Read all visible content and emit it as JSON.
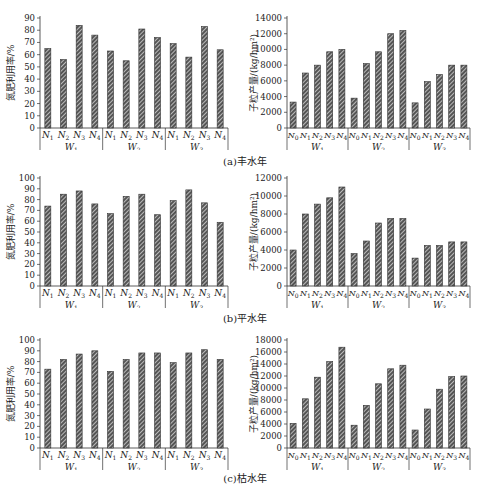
{
  "figure": {
    "captions": [
      "(a)丰水年",
      "(b)平水年",
      "(c)枯水年"
    ]
  },
  "colors": {
    "bar_fill": "#555555",
    "hatch": "#ffffff",
    "axis": "#333333"
  },
  "chart_data": [
    {
      "id": "a-left",
      "type": "bar",
      "title": "(a)丰水年",
      "ylabel": "氮肥利用率/%",
      "ylim": [
        0,
        90
      ],
      "yticks": [
        0,
        10,
        20,
        30,
        40,
        50,
        60,
        70,
        80,
        90
      ],
      "groups": [
        "W1",
        "W2",
        "W3"
      ],
      "categories": [
        "N1",
        "N2",
        "N3",
        "N4"
      ],
      "values": [
        [
          65,
          56,
          84,
          76
        ],
        [
          63,
          55,
          81,
          74
        ],
        [
          69,
          58,
          83,
          64
        ]
      ]
    },
    {
      "id": "a-right",
      "type": "bar",
      "title": "(a)丰水年",
      "ylabel": "子粒产量/(kg/hm²)",
      "ylim": [
        0,
        14000
      ],
      "yticks": [
        0,
        2000,
        4000,
        6000,
        8000,
        10000,
        12000,
        14000
      ],
      "groups": [
        "W1",
        "W2",
        "W3"
      ],
      "categories": [
        "N0",
        "N1",
        "N2",
        "N3",
        "N4"
      ],
      "values": [
        [
          3300,
          7000,
          8000,
          9700,
          10000
        ],
        [
          3800,
          8200,
          9700,
          12000,
          12400
        ],
        [
          3200,
          5900,
          6800,
          8000,
          8000
        ]
      ]
    },
    {
      "id": "b-left",
      "type": "bar",
      "title": "(b)平水年",
      "ylabel": "氮肥利用率/%",
      "ylim": [
        0,
        100
      ],
      "yticks": [
        0,
        10,
        20,
        30,
        40,
        50,
        60,
        70,
        80,
        90,
        100
      ],
      "groups": [
        "W1",
        "W2",
        "W3"
      ],
      "categories": [
        "N1",
        "N2",
        "N3",
        "N4"
      ],
      "values": [
        [
          74,
          85,
          88,
          76
        ],
        [
          67,
          83,
          85,
          66
        ],
        [
          79,
          89,
          77,
          59
        ]
      ]
    },
    {
      "id": "b-right",
      "type": "bar",
      "title": "(b)平水年",
      "ylabel": "子粒产量/(kg/hm²)",
      "ylim": [
        0,
        12000
      ],
      "yticks": [
        0,
        2000,
        4000,
        6000,
        8000,
        10000,
        12000
      ],
      "groups": [
        "W1",
        "W2",
        "W3"
      ],
      "categories": [
        "N0",
        "N1",
        "N2",
        "N3",
        "N4"
      ],
      "values": [
        [
          4000,
          8000,
          9100,
          9800,
          11000
        ],
        [
          3600,
          5000,
          7000,
          7500,
          7500
        ],
        [
          3100,
          4500,
          4500,
          4900,
          4900
        ]
      ]
    },
    {
      "id": "c-left",
      "type": "bar",
      "title": "(c)枯水年",
      "ylabel": "氮肥利用率/%",
      "ylim": [
        0,
        100
      ],
      "yticks": [
        0,
        10,
        20,
        30,
        40,
        50,
        60,
        70,
        80,
        90,
        100
      ],
      "groups": [
        "W1",
        "W2",
        "W3"
      ],
      "categories": [
        "N1",
        "N2",
        "N3",
        "N4"
      ],
      "values": [
        [
          73,
          82,
          87,
          90
        ],
        [
          71,
          82,
          88,
          88
        ],
        [
          79,
          88,
          91,
          82
        ]
      ]
    },
    {
      "id": "c-right",
      "type": "bar",
      "title": "(c)枯水年",
      "ylabel": "子粒产量/(kg/hm²)",
      "ylim": [
        0,
        18000
      ],
      "yticks": [
        0,
        2000,
        4000,
        6000,
        8000,
        10000,
        12000,
        14000,
        16000,
        18000
      ],
      "groups": [
        "W1",
        "W2",
        "W3"
      ],
      "categories": [
        "N0",
        "N1",
        "N2",
        "N3",
        "N4"
      ],
      "values": [
        [
          4100,
          8200,
          11800,
          14400,
          16800
        ],
        [
          3800,
          7100,
          10700,
          13200,
          13800
        ],
        [
          3000,
          6500,
          9800,
          11900,
          12000
        ]
      ]
    }
  ]
}
